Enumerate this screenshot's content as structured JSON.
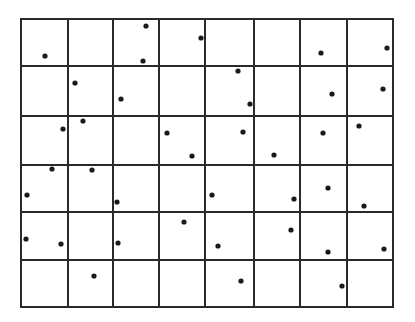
{
  "diagram": {
    "type": "point-grid",
    "grid": {
      "columns": 8,
      "rows": 6,
      "x_edges": [
        21,
        68,
        113,
        159,
        205,
        254,
        300,
        347,
        393
      ],
      "y_edges": [
        19,
        66,
        116,
        165,
        212,
        260,
        307
      ],
      "line_color": "#2a2a2a",
      "line_width": 2
    },
    "points": {
      "color": "#1a1a1a",
      "radius": 2.6,
      "coords": [
        [
          45,
          56
        ],
        [
          146,
          26
        ],
        [
          143,
          61
        ],
        [
          201,
          38
        ],
        [
          321,
          53
        ],
        [
          387,
          48
        ],
        [
          75,
          83
        ],
        [
          121,
          99
        ],
        [
          238,
          71
        ],
        [
          250,
          104
        ],
        [
          332,
          94
        ],
        [
          383,
          89
        ],
        [
          63,
          129
        ],
        [
          83,
          121
        ],
        [
          167,
          133
        ],
        [
          192,
          156
        ],
        [
          243,
          132
        ],
        [
          274,
          155
        ],
        [
          323,
          133
        ],
        [
          359,
          126
        ],
        [
          52,
          169
        ],
        [
          92,
          170
        ],
        [
          27,
          195
        ],
        [
          117,
          202
        ],
        [
          212,
          195
        ],
        [
          294,
          199
        ],
        [
          328,
          188
        ],
        [
          364,
          206
        ],
        [
          26,
          239
        ],
        [
          61,
          244
        ],
        [
          118,
          243
        ],
        [
          184,
          222
        ],
        [
          218,
          246
        ],
        [
          291,
          230
        ],
        [
          328,
          252
        ],
        [
          384,
          249
        ],
        [
          94,
          276
        ],
        [
          241,
          281
        ],
        [
          342,
          286
        ]
      ]
    }
  }
}
